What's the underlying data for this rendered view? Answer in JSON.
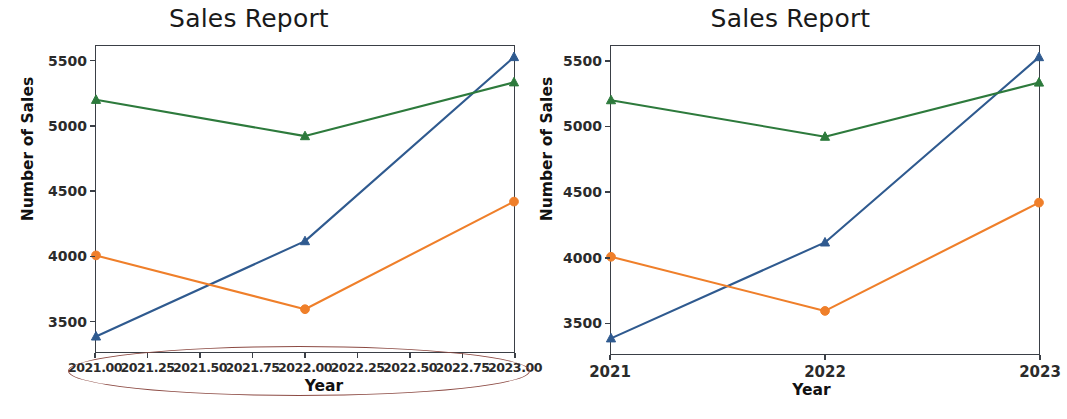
{
  "figure": {
    "background": "#ffffff",
    "panels": [
      {
        "id": "left",
        "title": "Sales Report",
        "xlabel": "Year",
        "ylabel": "Number of Sales",
        "xtick_labels": [
          "2021.00",
          "2021.25",
          "2021.50",
          "2021.75",
          "2022.00",
          "2022.25",
          "2022.50",
          "2022.75",
          "2023.00"
        ],
        "ytick_labels": [
          "3500",
          "4000",
          "4500",
          "5000",
          "5500"
        ],
        "annotation": {
          "shape": "ellipse",
          "color": "#8c4a43",
          "target": "x-axis-tick-labels"
        }
      },
      {
        "id": "right",
        "title": "Sales Report",
        "xlabel": "Year",
        "ylabel": "Number of Sales",
        "xtick_labels": [
          "2021",
          "2022",
          "2023"
        ],
        "ytick_labels": [
          "3500",
          "4000",
          "4500",
          "5000",
          "5500"
        ]
      }
    ]
  },
  "chart_data": [
    {
      "type": "line",
      "title": "Sales Report",
      "xlabel": "Year",
      "ylabel": "Number of Sales",
      "x": [
        2021,
        2022,
        2023
      ],
      "xlim": [
        2021,
        2023
      ],
      "ylim": [
        3260,
        5620
      ],
      "xticks": [
        2021.0,
        2021.25,
        2021.5,
        2021.75,
        2022.0,
        2022.25,
        2022.5,
        2022.75,
        2023.0
      ],
      "xticklabels": [
        "2021.00",
        "2021.25",
        "2021.50",
        "2021.75",
        "2022.00",
        "2022.25",
        "2022.50",
        "2022.75",
        "2023.00"
      ],
      "yticks": [
        3500,
        4000,
        4500,
        5000,
        5500
      ],
      "grid": false,
      "legend": "none",
      "series": [
        {
          "name": "series-1",
          "color": "#2f5a8f",
          "marker": "triangle-up",
          "values": [
            3380,
            4115,
            5535
          ]
        },
        {
          "name": "series-2",
          "color": "#ef7f2a",
          "marker": "circle",
          "values": [
            4005,
            3590,
            4420
          ]
        },
        {
          "name": "series-3",
          "color": "#2d7a3c",
          "marker": "triangle-up",
          "values": [
            5205,
            4925,
            5340
          ]
        }
      ]
    },
    {
      "type": "line",
      "title": "Sales Report",
      "xlabel": "Year",
      "ylabel": "Number of Sales",
      "x": [
        2021,
        2022,
        2023
      ],
      "xlim": [
        2021,
        2023
      ],
      "ylim": [
        3260,
        5620
      ],
      "xticks": [
        2021,
        2022,
        2023
      ],
      "xticklabels": [
        "2021",
        "2022",
        "2023"
      ],
      "yticks": [
        3500,
        4000,
        4500,
        5000,
        5500
      ],
      "grid": false,
      "legend": "none",
      "series": [
        {
          "name": "series-1",
          "color": "#2f5a8f",
          "marker": "triangle-up",
          "values": [
            3380,
            4115,
            5535
          ]
        },
        {
          "name": "series-2",
          "color": "#ef7f2a",
          "marker": "circle",
          "values": [
            4005,
            3590,
            4420
          ]
        },
        {
          "name": "series-3",
          "color": "#2d7a3c",
          "marker": "triangle-up",
          "values": [
            5205,
            4925,
            5340
          ]
        }
      ]
    }
  ]
}
